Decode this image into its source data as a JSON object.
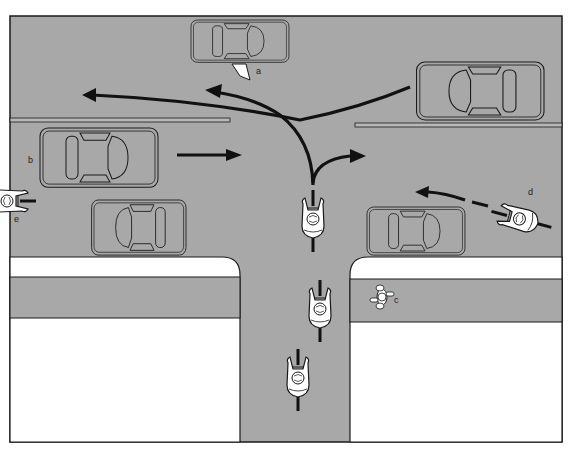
{
  "diagram": {
    "colors": {
      "road": "#a8a8a8",
      "sidewalk": "#ffffff",
      "outline": "#1a1a1a",
      "arrow": "#111111",
      "rider": "#ffffff"
    },
    "labels": {
      "a": "a",
      "b": "b",
      "c": "c",
      "d": "d",
      "e": "e"
    },
    "elements": {
      "car_a": "Parked car with driver door opening (a)",
      "car_b": "Car driving east (b)",
      "car_parked_left": "Parked car left lower lane",
      "car_parked_right": "Parked car right lower lane",
      "car_oncoming": "Oncoming car turning left across path",
      "pedestrian_c": "Pedestrian on sidewalk (c)",
      "cyclist_d": "Cyclist riding west (d)",
      "cyclist_e": "Cyclist at left edge (e)",
      "cyclists_main": "Three cyclists riding north on cross street"
    }
  }
}
